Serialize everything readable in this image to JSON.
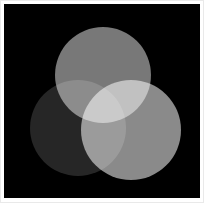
{
  "figure": {
    "background_color": "#000000",
    "frame_color": "#e9e9e9",
    "page_color": "#ffffff",
    "width": 204,
    "height": 203,
    "blend_mode": "screen"
  },
  "chart_data": {
    "type": "venn",
    "subtitle": "",
    "xlabel": "",
    "ylabel": "",
    "grid": false,
    "legend_position": "none",
    "background_color": "#000000",
    "canvas": {
      "x": 4,
      "y": 4,
      "width": 196,
      "height": 194
    },
    "sets": [
      {
        "name": "top",
        "label": "Top circle",
        "cx": 99,
        "cy": 71,
        "r": 48,
        "fill": "#787878",
        "measured_gray": 120
      },
      {
        "name": "bottom-left",
        "label": "Bottom-left circle",
        "cx": 74,
        "cy": 124,
        "r": 48,
        "fill": "#262626",
        "measured_gray": 38
      },
      {
        "name": "bottom-right",
        "label": "Bottom-right circle",
        "cx": 127,
        "cy": 126,
        "r": 50,
        "fill": "#8a8a8a",
        "measured_gray": 138
      }
    ],
    "regions": [
      {
        "name": "background",
        "sets": [],
        "color": "#000000",
        "gray": 0
      },
      {
        "name": "top-only",
        "sets": [
          "top"
        ],
        "color": "#787878",
        "gray": 120
      },
      {
        "name": "bottom-left-only",
        "sets": [
          "bottom-left"
        ],
        "color": "#262626",
        "gray": 38
      },
      {
        "name": "bottom-right-only",
        "sets": [
          "bottom-right"
        ],
        "color": "#8a8a8a",
        "gray": 138
      },
      {
        "name": "top-and-bottom-left",
        "sets": [
          "top",
          "bottom-left"
        ],
        "color": "#6e6e6e",
        "gray": 110
      },
      {
        "name": "top-and-bottom-right",
        "sets": [
          "top",
          "bottom-right"
        ],
        "color": "#d4d4d4",
        "gray": 212
      },
      {
        "name": "bottom-left-and-bottom-right",
        "sets": [
          "bottom-left",
          "bottom-right"
        ],
        "color": "#b4b4b4",
        "gray": 180
      },
      {
        "name": "all-three",
        "sets": [
          "top",
          "bottom-left",
          "bottom-right"
        ],
        "color": "#ffffff",
        "gray": 255
      }
    ]
  }
}
